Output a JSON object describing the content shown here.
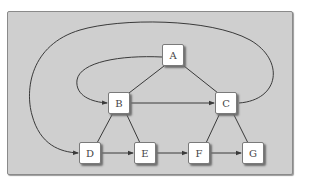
{
  "diagram": {
    "type": "directed-graph",
    "background_color": "#cfcfcf",
    "edge_color": "#3a3a3a",
    "nodes": [
      {
        "id": "A",
        "label": "A"
      },
      {
        "id": "B",
        "label": "B"
      },
      {
        "id": "C",
        "label": "C"
      },
      {
        "id": "D",
        "label": "D"
      },
      {
        "id": "E",
        "label": "E"
      },
      {
        "id": "F",
        "label": "F"
      },
      {
        "id": "G",
        "label": "G"
      }
    ],
    "edges": [
      {
        "from": "A",
        "to": "B",
        "directed": false,
        "style": "straight"
      },
      {
        "from": "A",
        "to": "C",
        "directed": false,
        "style": "straight"
      },
      {
        "from": "A",
        "to": "B",
        "directed": true,
        "style": "curved-left"
      },
      {
        "from": "B",
        "to": "C",
        "directed": true,
        "style": "straight"
      },
      {
        "from": "C",
        "to": "D",
        "directed": true,
        "style": "curved-over-top"
      },
      {
        "from": "B",
        "to": "D",
        "directed": false,
        "style": "straight"
      },
      {
        "from": "B",
        "to": "E",
        "directed": false,
        "style": "straight"
      },
      {
        "from": "C",
        "to": "F",
        "directed": false,
        "style": "straight"
      },
      {
        "from": "C",
        "to": "G",
        "directed": false,
        "style": "straight"
      },
      {
        "from": "D",
        "to": "E",
        "directed": true,
        "style": "straight"
      },
      {
        "from": "E",
        "to": "F",
        "directed": true,
        "style": "straight"
      },
      {
        "from": "F",
        "to": "G",
        "directed": true,
        "style": "straight"
      }
    ]
  }
}
